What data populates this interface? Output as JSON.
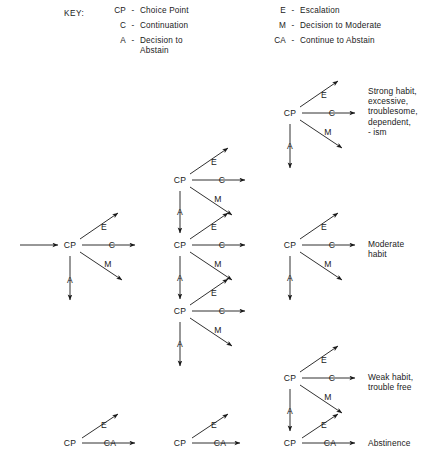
{
  "key": {
    "title": "KEY:",
    "left_column": [
      {
        "abbr": "CP",
        "dash": "-",
        "term": "Choice Point"
      },
      {
        "abbr": "C",
        "dash": "-",
        "term": "Continuation"
      },
      {
        "abbr": "A",
        "dash": "-",
        "term": "Decision to\nAbstain"
      }
    ],
    "right_column": [
      {
        "abbr": "E",
        "dash": "-",
        "term": "Escalation"
      },
      {
        "abbr": "M",
        "dash": "-",
        "term": "Decision to Moderate"
      },
      {
        "abbr": "CA",
        "dash": "-",
        "term": "Continue to Abstain"
      }
    ]
  },
  "diagram": {
    "type": "decision-tree",
    "node_labels": {
      "choice_point": "CP",
      "continuation": "C",
      "escalation": "E",
      "moderate": "M",
      "abstain": "A",
      "continue_abstain": "CA"
    },
    "nodes": [
      {
        "id": "cp-root",
        "label": "CP",
        "x": 70,
        "y": 245
      },
      {
        "id": "cp-mid-1",
        "label": "CP",
        "x": 180,
        "y": 180
      },
      {
        "id": "cp-mid-2",
        "label": "CP",
        "x": 180,
        "y": 245
      },
      {
        "id": "cp-mid-3",
        "label": "CP",
        "x": 180,
        "y": 311
      },
      {
        "id": "cp-right-1",
        "label": "CP",
        "x": 290,
        "y": 113
      },
      {
        "id": "cp-right-2",
        "label": "CP",
        "x": 290,
        "y": 245
      },
      {
        "id": "cp-right-3",
        "label": "CP",
        "x": 290,
        "y": 378
      },
      {
        "id": "cpca-left",
        "label": "CP",
        "x": 70,
        "y": 443
      },
      {
        "id": "cpca-mid",
        "label": "CP",
        "x": 180,
        "y": 443
      },
      {
        "id": "cpca-right",
        "label": "CP",
        "x": 290,
        "y": 443
      }
    ],
    "outcomes": [
      {
        "id": "outcome-strong",
        "text": "Strong habit,\nexcessive,\ntroublesome,\ndependent,\n- ism",
        "x": 368,
        "y": 86
      },
      {
        "id": "outcome-moderate",
        "text": "Moderate\nhabit",
        "x": 368,
        "y": 239
      },
      {
        "id": "outcome-weak",
        "text": "Weak habit,\ntrouble free",
        "x": 368,
        "y": 372
      },
      {
        "id": "outcome-abstinence",
        "text": "Abstinence",
        "x": 368,
        "y": 438
      }
    ]
  }
}
